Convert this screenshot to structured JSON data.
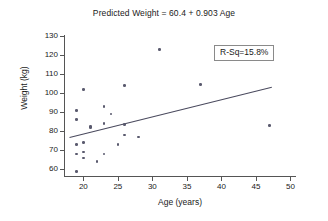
{
  "chart_data": {
    "type": "scatter",
    "title": "Predicted Weight = 60.4 + 0.903 Age",
    "xlabel": "Age (years)",
    "ylabel": "Weight (kg)",
    "xlim": [
      17.2,
      50.8
    ],
    "ylim": [
      56.5,
      130.5
    ],
    "xticks": [
      20,
      25,
      30,
      35,
      40,
      45,
      50
    ],
    "yticks": [
      60,
      70,
      80,
      90,
      100,
      110,
      120,
      130
    ],
    "grid": false,
    "legend": null,
    "annotations": [
      {
        "name": "r-squared",
        "text": "R-Sq=15.8%",
        "boxed": true,
        "x": 42.0,
        "y": 117.0
      }
    ],
    "fit_line": {
      "name": "regression-line",
      "equation": "Predicted Weight = 60.4 + 0.903 Age",
      "intercept": 60.4,
      "slope": 0.903,
      "x_start": 18.0,
      "y_start": 76.7,
      "x_end": 47.3,
      "y_end": 103.1,
      "color": "#4a4a5e"
    },
    "series": [
      {
        "name": "observations",
        "marker": "circle",
        "color": "#5a5a6e",
        "points": [
          [
            19.0,
            91.0
          ],
          [
            19.0,
            86.0
          ],
          [
            19.0,
            73.0
          ],
          [
            19.0,
            68.0
          ],
          [
            19.0,
            59.0
          ],
          [
            20.0,
            102.0
          ],
          [
            20.0,
            74.0
          ],
          [
            20.0,
            69.0
          ],
          [
            20.0,
            66.0
          ],
          [
            21.0,
            82.5
          ],
          [
            21.0,
            82.0
          ],
          [
            22.0,
            64.0
          ],
          [
            23.0,
            93.0
          ],
          [
            23.0,
            84.0
          ],
          [
            23.0,
            68.0
          ],
          [
            24.0,
            89.0
          ],
          [
            25.0,
            73.0
          ],
          [
            26.0,
            104.0
          ],
          [
            26.0,
            83.5
          ],
          [
            26.0,
            78.0
          ],
          [
            28.0,
            77.0
          ],
          [
            31.0,
            123.0
          ],
          [
            37.0,
            104.5
          ],
          [
            47.0,
            83.0
          ]
        ]
      }
    ],
    "n_points": 24
  }
}
